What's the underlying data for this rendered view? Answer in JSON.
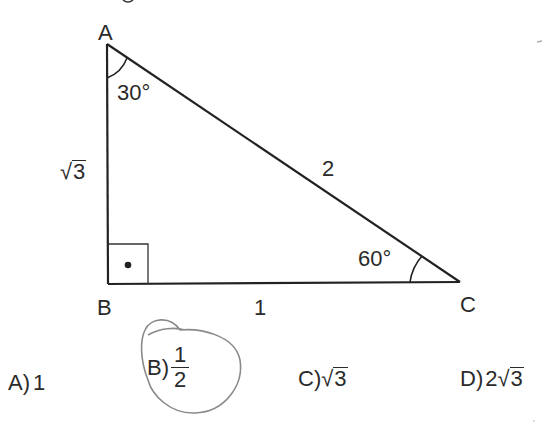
{
  "figure": {
    "vertices": {
      "A": {
        "label": "A",
        "x": 107,
        "y": 44
      },
      "B": {
        "label": "B",
        "x": 108,
        "y": 284
      },
      "C": {
        "label": "C",
        "x": 460,
        "y": 282
      }
    },
    "angles": {
      "A": "30°",
      "C": "60°",
      "B": "right-angle"
    },
    "sides": {
      "AB": {
        "label_radicand": "3",
        "label_prefix": ""
      },
      "AC": "2",
      "BC": "1"
    },
    "colors": {
      "stroke": "#222222",
      "marker": "#888888"
    }
  },
  "options": [
    {
      "letter": "A",
      "paren": ")",
      "value": "1"
    },
    {
      "letter": "B",
      "paren": ")",
      "num": "1",
      "den": "2",
      "circled": true
    },
    {
      "letter": "C",
      "paren": ")",
      "radicand": "3"
    },
    {
      "letter": "D",
      "paren": ")",
      "coef": "2",
      "radicand": "3"
    }
  ],
  "icons": {
    "sqrt": "√"
  }
}
